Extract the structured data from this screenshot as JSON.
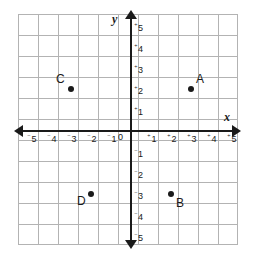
{
  "figure": {
    "background_color": "#ffffff",
    "grid_color": "#b3b3b3",
    "axis_color": "#1a1a1a"
  },
  "axes": {
    "x_name": "x",
    "y_name": "y",
    "origin_label": "0",
    "x_range": [
      -5,
      5
    ],
    "y_range": [
      -5,
      5
    ],
    "x_ticks": [
      {
        "value": -5,
        "sign": "⁻",
        "digit": "5"
      },
      {
        "value": -4,
        "sign": "⁻",
        "digit": "4"
      },
      {
        "value": -3,
        "sign": "⁻",
        "digit": "3"
      },
      {
        "value": -2,
        "sign": "⁻",
        "digit": "2"
      },
      {
        "value": -1,
        "sign": "⁻",
        "digit": "1"
      },
      {
        "value": 1,
        "sign": "⁺",
        "digit": "1"
      },
      {
        "value": 2,
        "sign": "⁺",
        "digit": "2"
      },
      {
        "value": 3,
        "sign": "⁺",
        "digit": "3"
      },
      {
        "value": 4,
        "sign": "⁺",
        "digit": "4"
      },
      {
        "value": 5,
        "sign": "⁺",
        "digit": "5"
      }
    ],
    "y_ticks": [
      {
        "value": 5,
        "sign": "⁺",
        "digit": "5"
      },
      {
        "value": 4,
        "sign": "⁺",
        "digit": "4"
      },
      {
        "value": 3,
        "sign": "⁺",
        "digit": "3"
      },
      {
        "value": 2,
        "sign": "⁺",
        "digit": "2"
      },
      {
        "value": 1,
        "sign": "⁺",
        "digit": "1"
      },
      {
        "value": -1,
        "sign": "⁻",
        "digit": "1"
      },
      {
        "value": -2,
        "sign": "⁻",
        "digit": "2"
      },
      {
        "value": -3,
        "sign": "⁻",
        "digit": "3"
      },
      {
        "value": -4,
        "sign": "⁻",
        "digit": "4"
      },
      {
        "value": -5,
        "sign": "⁻",
        "digit": "5"
      }
    ]
  },
  "chart_data": {
    "type": "scatter",
    "title": "",
    "xlabel": "x",
    "ylabel": "y",
    "xlim": [
      -5.5,
      5.5
    ],
    "ylim": [
      -5.5,
      5.5
    ],
    "grid": true,
    "legend": "none",
    "points": [
      {
        "label": "A",
        "x": 3,
        "y": 2,
        "label_position": "upper-right"
      },
      {
        "label": "B",
        "x": 2,
        "y": -3,
        "label_position": "lower-right"
      },
      {
        "label": "C",
        "x": -3,
        "y": 2,
        "label_position": "upper-left"
      },
      {
        "label": "D",
        "x": -2,
        "y": -3,
        "label_position": "lower-left"
      }
    ]
  }
}
